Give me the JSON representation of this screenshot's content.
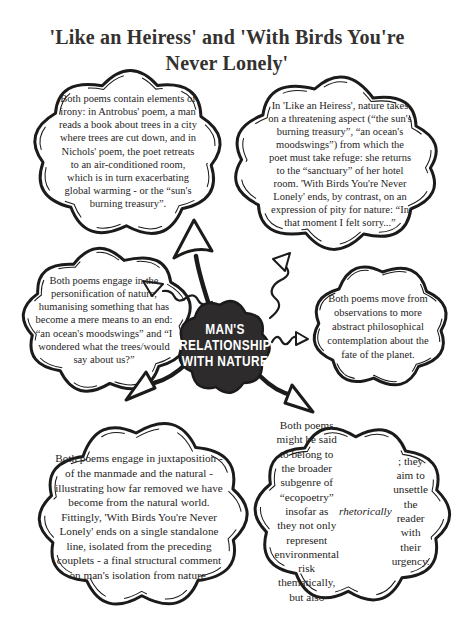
{
  "title": "'Like an Heiress' and 'With Birds You're Never Lonely'",
  "center": {
    "label": "MAN'S\nRELATIONSHIP\nWITH NATURE"
  },
  "clouds": {
    "irony": {
      "text": "Both poems contain elements of irony: in Antrobus' poem, a man reads a book about trees in a city where trees are cut down, and in Nichols' poem, the poet retreats to an air-conditioned room, which is in turn exacerbating global warming - or the “sun's burning treasury”."
    },
    "threat": {
      "text": "In 'Like an Heiress', nature takes on a threatening aspect (“the sun's burning treasury”, “an ocean's moodswings”) from which the poet must take refuge: she returns to the “sanctuary” of her hotel room. 'With Birds You're Never Lonely' ends, by contrast, on an expression of pity for nature: “In that moment I felt sorry...”"
    },
    "personification": {
      "text": "Both poems engage in the personification of nature, humanising something that has become a mere means to an end: “an ocean's moodswings” and “I wondered what the trees/would say about us?”"
    },
    "philosophy": {
      "text": "Both poems move from observations to more abstract philosophical contemplation about the fate of the planet."
    },
    "juxtaposition": {
      "text": "Both poems engage in juxtaposition - of the manmade and the natural - illustrating how far removed we have become from the natural world. Fittingly, 'With Birds You're Never Lonely' ends on a single standalone line, isolated from the preceding couplets - a final structural comment on man's isolation from nature."
    },
    "ecopoetry": {
      "text": "Both poems might be said to belong to the broader subgenre of “ecopoetry” insofar as they not only represent environmental risk thematically, but also *rhetorically*; they aim to unsettle the reader with their urgency."
    }
  },
  "colors": {
    "ink": "#1c1b1a",
    "paper": "#ffffff",
    "center_fill": "#2e2b2c",
    "center_text": "#ffffff"
  }
}
